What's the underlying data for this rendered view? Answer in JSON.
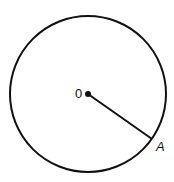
{
  "diagram": {
    "type": "circle-with-radius",
    "center": {
      "label": "0",
      "x": 88,
      "y": 94
    },
    "radius_px": 78,
    "point_a": {
      "label": "A",
      "x": 152,
      "y": 139
    },
    "stroke_color": "#111111"
  }
}
